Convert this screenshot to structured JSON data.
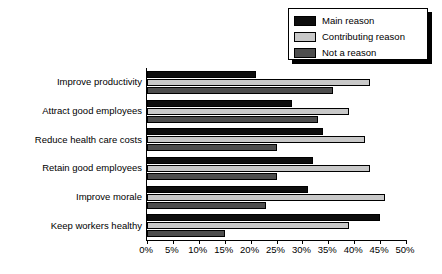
{
  "chart_data": {
    "type": "bar",
    "orientation": "horizontal",
    "title": "",
    "subtitle": "",
    "xlabel": "",
    "ylabel": "",
    "xlim": [
      0,
      50
    ],
    "xtick_step": 5,
    "xticks": [
      "0%",
      "5%",
      "10%",
      "15%",
      "20%",
      "25%",
      "30%",
      "35%",
      "40%",
      "45%",
      "50%"
    ],
    "xtick_values": [
      0,
      5,
      10,
      15,
      20,
      25,
      30,
      35,
      40,
      45,
      50
    ],
    "grid": false,
    "legend_position": "top-right",
    "categories": [
      "Improve productivity",
      "Attract good employees",
      "Reduce health care costs",
      "Retain good employees",
      "Improve morale",
      "Keep workers healthy"
    ],
    "series": [
      {
        "name": "Main reason",
        "color": "#0d0d0d",
        "values": [
          21,
          28,
          34,
          32,
          31,
          45
        ]
      },
      {
        "name": "Contributing reason",
        "color": "#c8c8c8",
        "values": [
          43,
          39,
          42,
          43,
          46,
          39
        ]
      },
      {
        "name": "Not a reason",
        "color": "#4d4d4d",
        "values": [
          36,
          33,
          25,
          25,
          23,
          15
        ]
      }
    ]
  },
  "legend": {
    "items": [
      {
        "label": "Main reason",
        "color": "#0d0d0d"
      },
      {
        "label": "Contributing reason",
        "color": "#c8c8c8"
      },
      {
        "label": "Not a reason",
        "color": "#4d4d4d"
      }
    ]
  }
}
